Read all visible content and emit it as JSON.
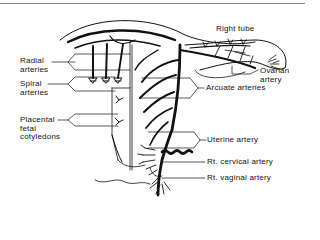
{
  "figure": {
    "labels": {
      "right_tube": "Right tube",
      "ovarian_artery": [
        "Ovarian",
        "artery"
      ],
      "arcuate_arteries": "Arcuate arteries",
      "radial_arteries": [
        "Radial",
        "arteries"
      ],
      "spiral_arteries": [
        "Spiral",
        "arteries"
      ],
      "placental_fetal_cotyledons": [
        "Placental",
        "fetal",
        "cotyledons"
      ],
      "uterine_artery": "Uterine artery",
      "rt_cervical_artery": "Rt. cervical artery",
      "rt_vaginal_artery": "Rt. vaginal artery"
    },
    "colors": {
      "ink": "#111111",
      "background": "#ffffff",
      "border": "#888888"
    }
  }
}
